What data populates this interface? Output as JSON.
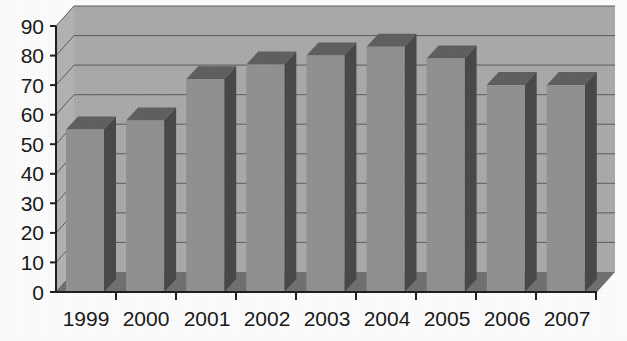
{
  "chart_data": {
    "type": "bar",
    "title": "",
    "subtitle": "",
    "xlabel": "",
    "ylabel": "",
    "categories": [
      "1999",
      "2000",
      "2001",
      "2002",
      "2003",
      "2004",
      "2005",
      "2006",
      "2007"
    ],
    "values": [
      55,
      58,
      72,
      77,
      80,
      83,
      79,
      70,
      70
    ],
    "series": [
      {
        "name": "",
        "values": [
          55,
          58,
          72,
          77,
          80,
          83,
          79,
          70,
          70
        ]
      }
    ],
    "ylim": [
      0,
      90
    ],
    "ytick_labels": [
      "0",
      "10",
      "20",
      "30",
      "40",
      "50",
      "60",
      "70",
      "80",
      "90"
    ],
    "ytick_values": [
      0,
      10,
      20,
      30,
      40,
      50,
      60,
      70,
      80,
      90
    ],
    "xtick_labels": [
      "1999",
      "2000",
      "2001",
      "2002",
      "2003",
      "2004",
      "2005",
      "2006",
      "2007"
    ],
    "grid": true,
    "grid_axis": "y",
    "legend": false,
    "legend_position": "none",
    "style": "3d-column",
    "annotations": []
  },
  "colors": {
    "plot_wall": "#a9a9a9",
    "plot_wall_top": "#b5b5b5",
    "floor": "#6f6f6f",
    "bar_front": "#909090",
    "bar_side": "#474747",
    "bar_top": "#5e5e5e",
    "gridline": "#5a5a5a",
    "axis": "#1c1c1c",
    "text": "#161616",
    "page_background": "#fdfdfd"
  },
  "axes": {
    "y_axis_name": "value-axis",
    "x_axis_name": "category-axis",
    "y_min_label": "0",
    "y_max_label": "90"
  }
}
